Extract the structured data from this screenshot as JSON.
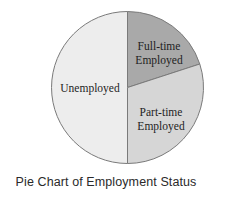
{
  "chart_data": {
    "type": "pie",
    "title": "Pie Chart of Employment Status",
    "values_note": "Approximate; no numeric labels shown, values estimated from slice geometry",
    "start_angle_deg": 0,
    "direction": "clockwise",
    "slices": [
      {
        "label": "Full-time Employed",
        "label_lines": [
          "Full-time",
          "Employed"
        ],
        "value": 20,
        "color": "#a9a9a9"
      },
      {
        "label": "Part-time Employed",
        "label_lines": [
          "Part-time",
          "Employed"
        ],
        "value": 30,
        "color": "#d6d6d6"
      },
      {
        "label": "Unemployed",
        "label_lines": [
          "Unemployed"
        ],
        "value": 50,
        "color": "#ededed"
      }
    ],
    "outline_color": "#7a7a7a",
    "legend": "none"
  },
  "chart": {
    "title": "Pie Chart of Employment Status",
    "labels": {
      "full_time_line1": "Full-time",
      "full_time_line2": "Employed",
      "part_time_line1": "Part-time",
      "part_time_line2": "Employed",
      "unemployed": "Unemployed"
    }
  }
}
